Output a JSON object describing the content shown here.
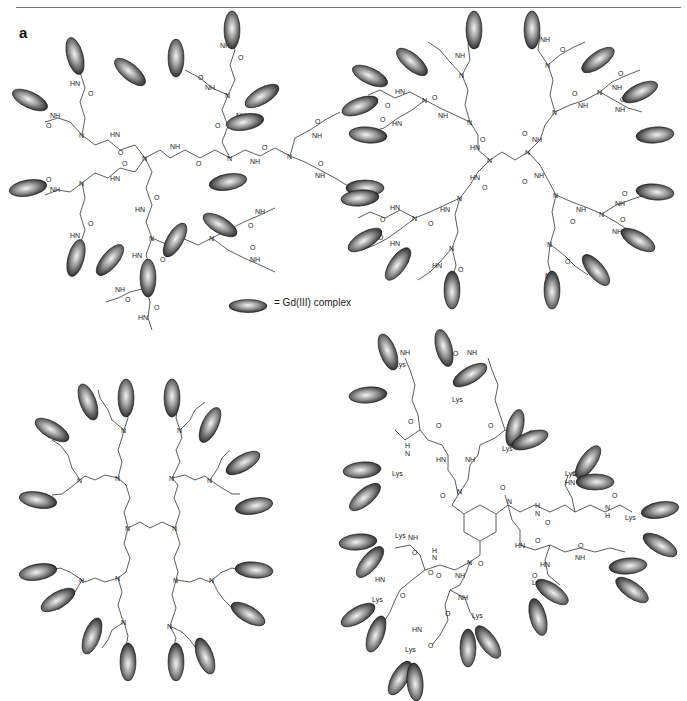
{
  "figure": {
    "panel_label": "a",
    "legend": {
      "symbol": "ellipse-gd-complex",
      "text": "= Gd(III) complex"
    },
    "structures": [
      {
        "id": "top-left",
        "description": "PAMAM-type dendrimer (G2) with 16 Gd(III) complexes",
        "atom_labels": [
          "N",
          "NH",
          "HN",
          "O"
        ],
        "gd_count": 16
      },
      {
        "id": "top-right",
        "description": "PAMAM-type dendrimer (G2, diaminobutane core) with 16 Gd(III) complexes",
        "atom_labels": [
          "N",
          "NH",
          "HN",
          "O"
        ],
        "gd_count": 16
      },
      {
        "id": "bottom-left",
        "description": "PPI dendrimer with 16 Gd(III) complexes",
        "atom_labels": [
          "N"
        ],
        "gd_count": 16
      },
      {
        "id": "bottom-right",
        "description": "Lysine-capped dendrimer with benzene tricarboxamide core",
        "atom_labels": [
          "Lys",
          "NH",
          "HN",
          "N",
          "O",
          "H"
        ],
        "gd_count": 24
      }
    ],
    "labels": {
      "n": "N",
      "nh": "NH",
      "hn": "HN",
      "o": "O",
      "h": "H",
      "lys": "Lys"
    }
  }
}
